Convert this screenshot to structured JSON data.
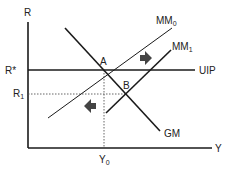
{
  "diagram": {
    "axes": {
      "y_label": "R",
      "x_label": "Y"
    },
    "levels": {
      "r_star": "R*",
      "r1": "R",
      "r1_sub": "1",
      "y0": "Y",
      "y0_sub": "0"
    },
    "curves": {
      "uip": "UIP",
      "gm": "GM",
      "mm0": "MM",
      "mm0_sub": "0",
      "mm1": "MM",
      "mm1_sub": "1"
    },
    "points": {
      "a": "A",
      "b": "B"
    },
    "arrows": {
      "shift_right": "right-arrow-icon",
      "shift_left": "left-arrow-icon"
    },
    "colors": {
      "line": "#1a1a1a",
      "dotted": "#555555",
      "arrow": "#444444"
    }
  }
}
